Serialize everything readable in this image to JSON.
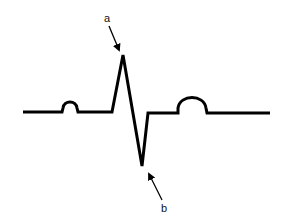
{
  "diagram": {
    "type": "ecg-waveform",
    "stroke_color": "#000000",
    "background": "#ffffff",
    "labels": [
      {
        "id": "a",
        "text": "a",
        "points_to": "R-wave peak (top of upward spike)"
      },
      {
        "id": "b",
        "text": "b",
        "points_to": "S-wave trough (bottom of downward spike)"
      }
    ],
    "components": [
      "baseline",
      "P wave",
      "QRS complex",
      "T wave"
    ]
  }
}
